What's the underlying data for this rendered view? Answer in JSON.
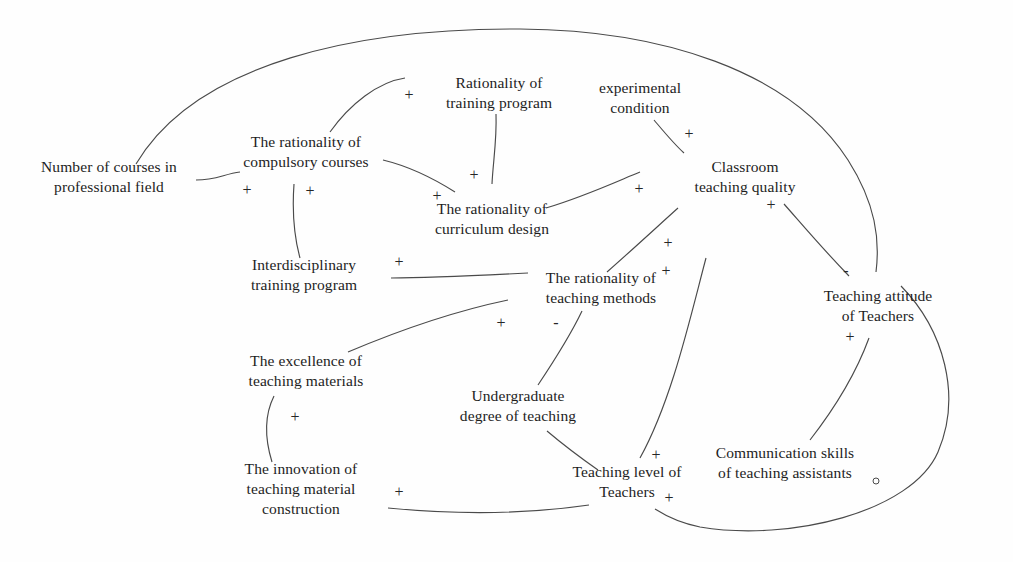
{
  "diagram": {
    "type": "causal-loop-diagram",
    "background_color": "#fefefe",
    "line_color": "#4a4a4a",
    "text_color": "#1d1d1d",
    "width": 1013,
    "height": 562,
    "nodes": [
      {
        "id": "num_courses",
        "label": "Number of courses in\nprofessional field",
        "x": 109,
        "y": 177
      },
      {
        "id": "compulsory",
        "label": "The rationality of\ncompulsory courses",
        "x": 306,
        "y": 152
      },
      {
        "id": "training_program",
        "label": "Rationality of\ntraining program",
        "x": 499,
        "y": 93
      },
      {
        "id": "curriculum",
        "label": "The rationality of\ncurriculum design",
        "x": 492,
        "y": 219
      },
      {
        "id": "experimental",
        "label": "experimental\ncondition",
        "x": 640,
        "y": 98
      },
      {
        "id": "classroom_quality",
        "label": "Classroom\nteaching quality",
        "x": 745,
        "y": 177
      },
      {
        "id": "interdisciplinary",
        "label": "Interdisciplinary\ntraining program",
        "x": 304,
        "y": 275
      },
      {
        "id": "teaching_methods",
        "label": "The rationality of\nteaching methods",
        "x": 601,
        "y": 288
      },
      {
        "id": "teaching_attitude",
        "label": "Teaching attitude\nof Teachers",
        "x": 878,
        "y": 306
      },
      {
        "id": "excellence",
        "label": "The excellence of\nteaching materials",
        "x": 306,
        "y": 371
      },
      {
        "id": "undergrad_degree",
        "label": "Undergraduate\ndegree of teaching",
        "x": 518,
        "y": 406
      },
      {
        "id": "innovation",
        "label": "The innovation of\nteaching material\nconstruction",
        "x": 301,
        "y": 489
      },
      {
        "id": "teaching_level",
        "label": "Teaching level of\nTeachers",
        "x": 627,
        "y": 482
      },
      {
        "id": "communication",
        "label": "Communication skills\nof teaching assistants",
        "x": 785,
        "y": 463
      }
    ],
    "edges": [
      {
        "id": "e1",
        "from": "num_courses",
        "to": "compulsory",
        "polarity": "+",
        "sign_x": 247,
        "sign_y": 190
      },
      {
        "id": "e2",
        "from": "num_courses",
        "to": "teaching_attitude",
        "polarity": "-",
        "sign_x": 846,
        "sign_y": 271
      },
      {
        "id": "e3",
        "from": "compulsory",
        "to": "training_program",
        "polarity": "+",
        "sign_x": 409,
        "sign_y": 95
      },
      {
        "id": "e4",
        "from": "compulsory",
        "to": "curriculum",
        "polarity": "+",
        "sign_x": 437,
        "sign_y": 196
      },
      {
        "id": "e5",
        "from": "training_program",
        "to": "curriculum",
        "polarity": "+",
        "sign_x": 474,
        "sign_y": 175
      },
      {
        "id": "e6",
        "from": "interdisciplinary",
        "to": "compulsory",
        "polarity": "+",
        "sign_x": 310,
        "sign_y": 191
      },
      {
        "id": "e7",
        "from": "experimental",
        "to": "classroom_quality",
        "polarity": "+",
        "sign_x": 689,
        "sign_y": 134
      },
      {
        "id": "e8",
        "from": "curriculum",
        "to": "classroom_quality",
        "polarity": "+",
        "sign_x": 639,
        "sign_y": 189
      },
      {
        "id": "e9",
        "from": "teaching_methods",
        "to": "classroom_quality",
        "polarity": "+",
        "sign_x": 668,
        "sign_y": 243
      },
      {
        "id": "e10",
        "from": "teaching_level",
        "to": "classroom_quality",
        "polarity": "+",
        "sign_x": 666,
        "sign_y": 271
      },
      {
        "id": "e11",
        "from": "teaching_attitude",
        "to": "classroom_quality",
        "polarity": "+",
        "sign_x": 771,
        "sign_y": 205
      },
      {
        "id": "e12",
        "from": "teaching_methods",
        "to": "interdisciplinary",
        "polarity": "+",
        "sign_x": 399,
        "sign_y": 262
      },
      {
        "id": "e13",
        "from": "excellence",
        "to": "teaching_methods",
        "polarity": "+",
        "sign_x": 501,
        "sign_y": 323
      },
      {
        "id": "e14",
        "from": "undergrad_degree",
        "to": "teaching_methods",
        "polarity": "-",
        "sign_x": 556,
        "sign_y": 323
      },
      {
        "id": "e15",
        "from": "innovation",
        "to": "excellence",
        "polarity": "+",
        "sign_x": 295,
        "sign_y": 417
      },
      {
        "id": "e16",
        "from": "teaching_level",
        "to": "undergrad_degree",
        "polarity": "+",
        "sign_x": 656,
        "sign_y": 455
      },
      {
        "id": "e17",
        "from": "teaching_level",
        "to": "innovation",
        "polarity": "+",
        "sign_x": 399,
        "sign_y": 492
      },
      {
        "id": "e18",
        "from": "communication",
        "to": "teaching_attitude",
        "polarity": "+",
        "sign_x": 850,
        "sign_y": 337
      },
      {
        "id": "e19",
        "from": "teaching_attitude",
        "to": "teaching_level",
        "polarity": "+",
        "sign_x": 669,
        "sign_y": 498
      }
    ]
  }
}
